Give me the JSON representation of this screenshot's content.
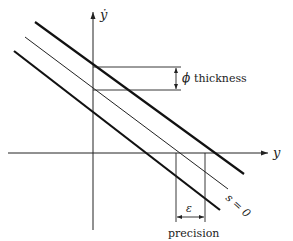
{
  "diagram": {
    "type": "sliding-mode boundary layer diagram",
    "axes": {
      "x_label": "y",
      "y_label": "ẏ"
    },
    "lines": [
      {
        "name": "upper-boundary",
        "style": "thick"
      },
      {
        "name": "sliding-surface",
        "style": "thin",
        "label": "s = 0"
      },
      {
        "name": "lower-boundary",
        "style": "thick"
      }
    ],
    "annotations": {
      "thickness_symbol": "ϕ",
      "thickness_label": "thickness",
      "precision_symbol": "ε",
      "precision_label": "precision",
      "surface_label": "s = 0"
    },
    "colors": {
      "line": "#222222",
      "background": "#ffffff"
    }
  }
}
